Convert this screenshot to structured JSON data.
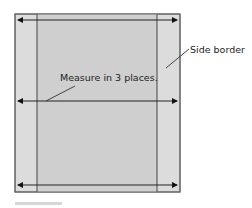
{
  "diagram": {
    "labels": {
      "measure": "Measure in 3 places.",
      "side_border": "Side border"
    },
    "colors": {
      "border_fill": "#dcdcdc",
      "center_fill": "#cfcfcf",
      "line": "#444444",
      "arrow": "#111111",
      "footer_bar": "#d6d6d6"
    },
    "arrows": [
      {
        "name": "top",
        "y": 20
      },
      {
        "name": "middle",
        "y": 101
      },
      {
        "name": "bottom",
        "y": 185
      }
    ]
  }
}
